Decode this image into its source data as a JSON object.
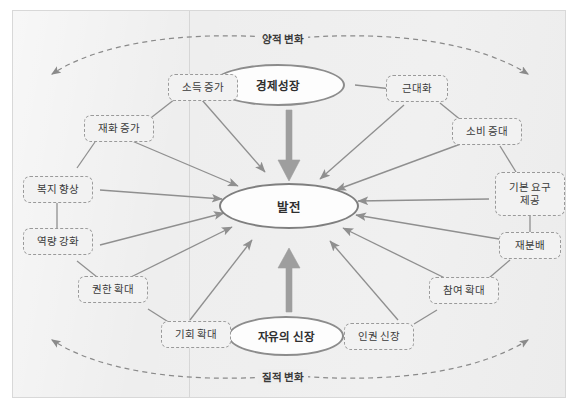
{
  "diagram": {
    "background_color": "#eeeeee",
    "frame_border_color": "#d8d8d8",
    "node_border_color": "#9a9a9a",
    "connector_color": "#8f8f8f",
    "thick_arrow_color": "#9e9e9e"
  },
  "core": {
    "top": "경제성장",
    "center": "발전",
    "bottom": "자유의 신장"
  },
  "arcs": {
    "top_label": "양적 변화",
    "bottom_label": "질적 변화"
  },
  "nodes": [
    {
      "id": "income-increase",
      "label": "소득 증가"
    },
    {
      "id": "goods-increase",
      "label": "재화 증가"
    },
    {
      "id": "welfare-improve",
      "label": "복지 향상"
    },
    {
      "id": "capacity-strengthen",
      "label": "역량 강화"
    },
    {
      "id": "authority-expand",
      "label": "권한 확대"
    },
    {
      "id": "opportunity-expand",
      "label": "기회 확대"
    },
    {
      "id": "modernization",
      "label": "근대화"
    },
    {
      "id": "consumption-increase",
      "label": "소비 증대"
    },
    {
      "id": "basic-needs",
      "label": "기본 요구\n제공"
    },
    {
      "id": "redistribution",
      "label": "재분배"
    },
    {
      "id": "participation-expand",
      "label": "참여 확대"
    },
    {
      "id": "human-rights",
      "label": "인권 신장"
    }
  ]
}
